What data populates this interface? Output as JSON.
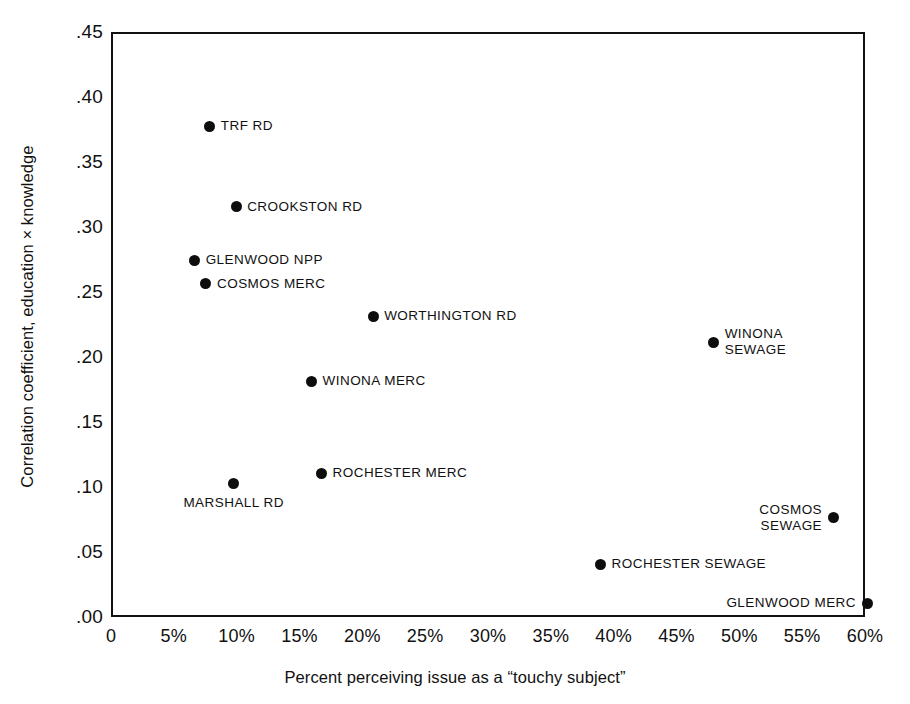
{
  "chart_data": {
    "type": "scatter",
    "title": "",
    "xlabel": "Percent perceiving issue as a “touchy subject”",
    "ylabel": "Correlation coefficient, education × knowledge",
    "xlim": [
      0,
      60
    ],
    "ylim": [
      0.0,
      0.45
    ],
    "grid": false,
    "legend": "none",
    "x_tick_labels": [
      "0",
      "5%",
      "10%",
      "15%",
      "20%",
      "25%",
      "30%",
      "35%",
      "40%",
      "45%",
      "50%",
      "55%",
      "60%"
    ],
    "x_tick_values": [
      0,
      5,
      10,
      15,
      20,
      25,
      30,
      35,
      40,
      45,
      50,
      55,
      60
    ],
    "y_tick_labels": [
      ".45",
      ".40",
      ".35",
      ".30",
      ".25",
      ".20",
      ".15",
      ".10",
      ".05",
      ".00"
    ],
    "y_tick_values": [
      0.45,
      0.4,
      0.35,
      0.3,
      0.25,
      0.2,
      0.15,
      0.1,
      0.05,
      0.0
    ],
    "marker_color": "#0d0d0d",
    "points": [
      {
        "label": "TRF RD",
        "x": 7.7,
        "y": 0.379,
        "label_pos": "right"
      },
      {
        "label": "CROOKSTON RD",
        "x": 9.8,
        "y": 0.317,
        "label_pos": "right"
      },
      {
        "label": "GLENWOOD NPP",
        "x": 6.5,
        "y": 0.276,
        "label_pos": "right"
      },
      {
        "label": "COSMOS MERC",
        "x": 7.4,
        "y": 0.258,
        "label_pos": "right"
      },
      {
        "label": "WORTHINGTON RD",
        "x": 20.7,
        "y": 0.233,
        "label_pos": "right"
      },
      {
        "label": "WINONA\nSEWAGE",
        "x": 47.8,
        "y": 0.213,
        "label_pos": "right"
      },
      {
        "label": "WINONA MERC",
        "x": 15.8,
        "y": 0.183,
        "label_pos": "right"
      },
      {
        "label": "ROCHESTER MERC",
        "x": 16.6,
        "y": 0.112,
        "label_pos": "right"
      },
      {
        "label": "MARSHALL RD",
        "x": 9.6,
        "y": 0.104,
        "label_pos": "below"
      },
      {
        "label": "COSMOS\nSEWAGE",
        "x": 57.3,
        "y": 0.078,
        "label_pos": "left"
      },
      {
        "label": "ROCHESTER SEWAGE",
        "x": 38.8,
        "y": 0.042,
        "label_pos": "right"
      },
      {
        "label": "GLENWOOD MERC",
        "x": 60.0,
        "y": 0.012,
        "label_pos": "left"
      }
    ]
  }
}
